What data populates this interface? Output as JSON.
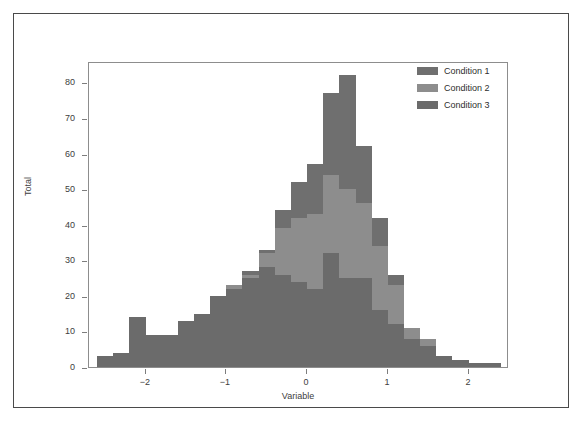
{
  "figure": {
    "background_color": "#ffffff",
    "frame_color": "#4a4a4a",
    "panel_border_color": "#8d8d8d"
  },
  "legend": {
    "position": "top-right",
    "entries": [
      {
        "label": "Condition 1",
        "color": "#6f6f6f"
      },
      {
        "label": "Condition 2",
        "color": "#8d8d8d"
      },
      {
        "label": "Condition 3",
        "color": "#6b6b6b"
      }
    ]
  },
  "axes": {
    "y": {
      "label": "Total",
      "ticks": [
        "0",
        "10",
        "20",
        "30",
        "40",
        "50",
        "60",
        "70",
        "80"
      ],
      "min": 0,
      "max": 86
    },
    "x": {
      "label": "Variable",
      "ticks": [
        "-2",
        "-1",
        "0",
        "1",
        "2"
      ],
      "min": -2.7,
      "max": 2.5
    }
  },
  "chart_data": {
    "type": "bar",
    "subtype": "stacked-histogram",
    "title": "",
    "xlabel": "Variable",
    "ylabel": "Total",
    "xlim": [
      -2.7,
      2.5
    ],
    "ylim": [
      0,
      86
    ],
    "grid": false,
    "legend_position": "top-right",
    "bin_width": 0.2,
    "bin_centers": [
      -2.5,
      -2.3,
      -2.1,
      -1.9,
      -1.7,
      -1.5,
      -1.3,
      -1.1,
      -0.9,
      -0.7,
      -0.5,
      -0.3,
      -0.1,
      0.1,
      0.3,
      0.5,
      0.7,
      0.9,
      1.1,
      1.3,
      1.5,
      1.7,
      1.9,
      2.1,
      2.3
    ],
    "series": [
      {
        "name": "Condition 3",
        "color": "#6b6b6b",
        "values": [
          3,
          4,
          14,
          9,
          9,
          13,
          15,
          20,
          22,
          25,
          28,
          26,
          24,
          22,
          32,
          25,
          25,
          16,
          12,
          8,
          6,
          3,
          2,
          1,
          1
        ]
      },
      {
        "name": "Condition 2",
        "color": "#8d8d8d",
        "values": [
          0,
          0,
          0,
          0,
          0,
          0,
          0,
          0,
          1,
          1,
          4,
          13,
          18,
          21,
          22,
          25,
          21,
          18,
          11,
          3,
          2,
          0,
          0,
          0,
          0
        ]
      },
      {
        "name": "Condition 1",
        "color": "#6f6f6f",
        "values": [
          0,
          0,
          0,
          0,
          0,
          0,
          0,
          0,
          0,
          1,
          1,
          5,
          10,
          14,
          23,
          32,
          16,
          8,
          3,
          0,
          0,
          0,
          0,
          0,
          0
        ]
      }
    ],
    "totals": [
      3,
      4,
      14,
      9,
      9,
      13,
      15,
      20,
      23,
      27,
      33,
      44,
      52,
      57,
      77,
      82,
      62,
      42,
      26,
      11,
      8,
      3,
      2,
      1,
      1
    ]
  }
}
